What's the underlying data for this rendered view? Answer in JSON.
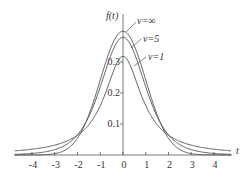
{
  "chart_data": {
    "type": "line",
    "title": "",
    "xlabel": "t",
    "ylabel": "f(t)",
    "xlim": [
      -4.6,
      4.6
    ],
    "ylim": [
      0,
      0.42
    ],
    "grid": false,
    "legend_position": "inline annotations near peaks",
    "x_ticks": [
      "-4",
      "-3",
      "-2",
      "-1",
      "0",
      "1",
      "2",
      "3",
      "4"
    ],
    "y_ticks": [
      "0.1",
      "0.2",
      "0.3"
    ],
    "series": [
      {
        "name": "ν=∞",
        "label": "ν=∞",
        "dof": "inf",
        "peak": 0.399
      },
      {
        "name": "ν=5",
        "label": "ν=5",
        "dof": 5,
        "peak": 0.38
      },
      {
        "name": "ν=1",
        "label": "ν=1",
        "dof": 1,
        "peak": 0.318
      }
    ]
  },
  "labels": {
    "ylabel": "f(t)",
    "xlabel": "t",
    "nu_inf": "ν=∞",
    "nu_5": "ν=5",
    "nu_1": "ν=1"
  }
}
